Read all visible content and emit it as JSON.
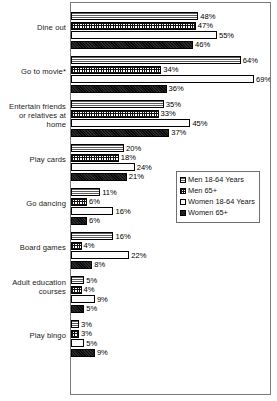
{
  "chart_data": {
    "type": "bar",
    "orientation": "horizontal",
    "title": "",
    "subtitle": "",
    "xlabel": "",
    "ylabel": "",
    "xlim": [
      0,
      75
    ],
    "grid": false,
    "legend_position": "middle-right",
    "value_suffix": "%",
    "categories": [
      "Dine out",
      "Go to movie*",
      "Entertain friends or relatives at home",
      "Play cards",
      "Go dancing",
      "Board games",
      "Adult education courses",
      "Play bingo"
    ],
    "series": [
      {
        "name": "Men 18-64 Years",
        "pattern": "horizontal-lines",
        "values": [
          48,
          64,
          35,
          20,
          11,
          16,
          5,
          3
        ],
        "labels": [
          "48%",
          "64%",
          "35%",
          "20%",
          "11%",
          "16%",
          "5%",
          "3%"
        ]
      },
      {
        "name": "Men 65+",
        "pattern": "crosshatch-grid",
        "values": [
          47,
          34,
          33,
          18,
          6,
          4,
          4,
          3
        ],
        "labels": [
          "47%",
          "34%",
          "33%",
          "18%",
          "6%",
          "4%",
          "4%",
          "3%"
        ]
      },
      {
        "name": "Women 18-64 Years",
        "pattern": "fine-dots",
        "values": [
          55,
          69,
          45,
          24,
          16,
          22,
          9,
          5
        ],
        "labels": [
          "55%",
          "69%",
          "45%",
          "24%",
          "16%",
          "22%",
          "9%",
          "5%"
        ]
      },
      {
        "name": "Women 65+",
        "pattern": "solid-black",
        "values": [
          46,
          36,
          37,
          21,
          6,
          8,
          5,
          9
        ],
        "labels": [
          "46%",
          "36%",
          "37%",
          "45%",
          "6%",
          "8%",
          "5%",
          "9%"
        ]
      }
    ]
  },
  "legend": {
    "items": [
      {
        "label": "Men 18-64 Years"
      },
      {
        "label": "Men 65+"
      },
      {
        "label": "Women 18-64 Years"
      },
      {
        "label": "Women 65+"
      }
    ]
  }
}
